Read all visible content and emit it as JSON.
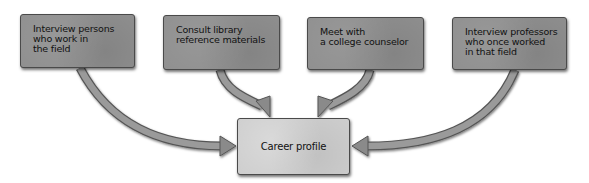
{
  "diagram": {
    "type": "flow",
    "sources": [
      {
        "id": "interview-persons",
        "label": "Interview persons\nwho work in\nthe field"
      },
      {
        "id": "consult-library",
        "label": "Consult library\nreference materials"
      },
      {
        "id": "meet-counselor",
        "label": "Meet with\na college counselor"
      },
      {
        "id": "interview-professors",
        "label": "Interview professors\nwho once worked\nin that field"
      }
    ],
    "target": {
      "id": "career-profile",
      "label": "Career profile"
    },
    "edges": [
      {
        "from": "interview-persons",
        "to": "career-profile"
      },
      {
        "from": "consult-library",
        "to": "career-profile"
      },
      {
        "from": "meet-counselor",
        "to": "career-profile"
      },
      {
        "from": "interview-professors",
        "to": "career-profile"
      }
    ],
    "colors": {
      "source_box": "#8f8f8f",
      "target_box": "#cdcdcd",
      "arrow_fill": "#9a9a9a",
      "arrow_outline": "#555555"
    }
  }
}
